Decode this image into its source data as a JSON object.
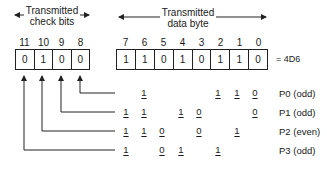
{
  "headers": {
    "check_bits": {
      "line1": "Transmitted",
      "line2": "check bits"
    },
    "data_byte": {
      "line1": "Transmitted",
      "line2": "data byte"
    }
  },
  "check_bits": {
    "positions": [
      "11",
      "10",
      "9",
      "8"
    ],
    "values": [
      "0",
      "1",
      "0",
      "0"
    ]
  },
  "data_byte": {
    "positions": [
      "7",
      "6",
      "5",
      "4",
      "3",
      "2",
      "1",
      "0"
    ],
    "values": [
      "1",
      "1",
      "0",
      "1",
      "0",
      "1",
      "1",
      "0"
    ],
    "hex_label": "= 4D6"
  },
  "parity_rows": [
    {
      "label": "P0 (odd)",
      "check_bit": "8",
      "digits": {
        "6": "1",
        "2": "1",
        "1": "1",
        "0": "0"
      }
    },
    {
      "label": "P1 (odd)",
      "check_bit": "9",
      "digits": {
        "7": "1",
        "6": "1",
        "4": "1",
        "3": "0",
        "0": "0"
      }
    },
    {
      "label": "P2 (even)",
      "check_bit": "10",
      "digits": {
        "7": "1",
        "6": "1",
        "5": "0",
        "3": "0",
        "1": "1"
      }
    },
    {
      "label": "P3 (odd)",
      "check_bit": "11",
      "digits": {
        "7": "1",
        "5": "0",
        "4": "1",
        "2": "1"
      }
    }
  ],
  "colors": {
    "line": "#222222",
    "background": "#ffffff"
  }
}
